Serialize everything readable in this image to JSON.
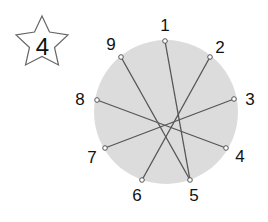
{
  "badge": {
    "number": "4",
    "shape": "star"
  },
  "colors": {
    "circle_fill": "#dcdcdc",
    "line": "#555555",
    "point": "#555555",
    "text": "#111111"
  },
  "circle": {
    "cx": 166,
    "cy": 112,
    "r": 72
  },
  "points": [
    {
      "label": "1",
      "x": 165,
      "y": 41,
      "lx": 165,
      "ly": 31
    },
    {
      "label": "2",
      "x": 210,
      "y": 57,
      "lx": 220,
      "ly": 53
    },
    {
      "label": "3",
      "x": 234,
      "y": 99,
      "lx": 250,
      "ly": 105
    },
    {
      "label": "4",
      "x": 226,
      "y": 148,
      "lx": 240,
      "ly": 162
    },
    {
      "label": "5",
      "x": 190,
      "y": 180,
      "lx": 194,
      "ly": 201
    },
    {
      "label": "6",
      "x": 142,
      "y": 180,
      "lx": 137,
      "ly": 201
    },
    {
      "label": "7",
      "x": 105,
      "y": 148,
      "lx": 92,
      "ly": 163
    },
    {
      "label": "8",
      "x": 97,
      "y": 100,
      "lx": 80,
      "ly": 105
    },
    {
      "label": "9",
      "x": 121,
      "y": 57,
      "lx": 111,
      "ly": 50
    }
  ],
  "connections": [
    [
      "1",
      "5"
    ],
    [
      "9",
      "5"
    ],
    [
      "2",
      "6"
    ],
    [
      "8",
      "4"
    ],
    [
      "3",
      "7"
    ]
  ]
}
